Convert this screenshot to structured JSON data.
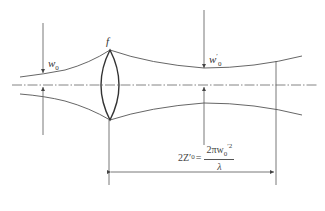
{
  "diagram": {
    "type": "gaussian-beam-focusing",
    "labels": {
      "lens": "f",
      "input_waist_symbol": "w",
      "input_waist_sub": "0",
      "output_waist_symbol": "w",
      "output_waist_prime": "′",
      "output_waist_sub": "0"
    },
    "formula": {
      "lhs": "2Z′",
      "lhs_sub": "0",
      "equals": "=",
      "numerator": "2πw",
      "numerator_sub": "0",
      "numerator_sup": "′2",
      "denominator": "λ"
    },
    "colors": {
      "line": "#444444",
      "axis": "#666666",
      "background": "#ffffff"
    }
  }
}
